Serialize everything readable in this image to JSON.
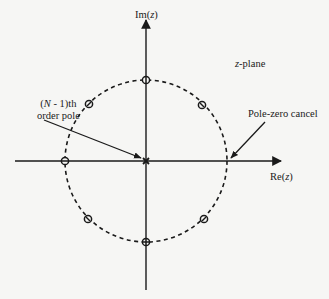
{
  "diagram": {
    "type": "pole-zero plot",
    "labels": {
      "imaginary_axis_prefix": "Im(",
      "imaginary_axis_var": "z",
      "imaginary_axis_suffix": ")",
      "real_axis_prefix": "Re(",
      "real_axis_var": "z",
      "real_axis_suffix": ")",
      "plane_var": "z",
      "plane_suffix": "-plane",
      "pole_zero_cancel": "Pole-zero cancel",
      "pole_line1_open": "(",
      "pole_line1_var": "N",
      "pole_line1_rest": " - 1)th",
      "pole_line2": "order pole"
    },
    "unit_circle": {
      "style": "dashed",
      "center": [
        146,
        161
      ],
      "radius": 81
    },
    "zeros_count": 7,
    "zero_angles_deg": [
      90,
      135,
      180,
      225,
      270,
      315,
      45
    ],
    "cancelled_angle_deg": 0,
    "pole_at_origin": "(N - 1)th order pole",
    "colors": {
      "ink": "#1a1a1a",
      "background": "#f6f6f4"
    }
  }
}
